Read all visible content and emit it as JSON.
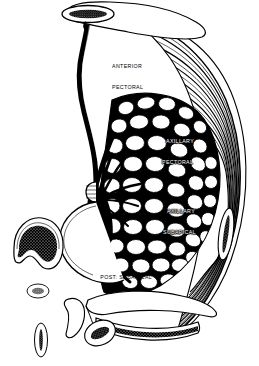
{
  "figure": {
    "type": "anatomical-line-illustration",
    "background_color": "#ffffff",
    "ink_color": "#000000",
    "width": 259,
    "height": 366
  },
  "labels": [
    {
      "id": "anterior-pectoral",
      "line1": "ANTERIOR",
      "line2": "PECTORAL",
      "color": "#000000"
    },
    {
      "id": "axillary-pectoral",
      "line1": "AXILLARY",
      "line2": "PECTORAL",
      "color": "#ffffff"
    },
    {
      "id": "axillary-subapical",
      "line1": "AXILLARY",
      "line2": "SUBAPICAL",
      "color": "#ffffff"
    },
    {
      "id": "post-subapical",
      "line1": "POST: SUBAPICAL",
      "line2": "",
      "color": "#000000"
    }
  ],
  "structures": {
    "apical_node": "apical-lymph-node",
    "clavicular_outline": "infraclavicular-outline",
    "pectoral_fascia": "striated-pectoral-fascia",
    "lymphatic_trunk": "main-lymphatic-trunk",
    "nipple_areola": "nipple-areola-profile",
    "breast_parenchyma": "lobular-breast-parenchyma",
    "isolated_nodes": [
      "large-kidney-node",
      "small-round-node",
      "narrow-oval-node",
      "bottom-oval-node",
      "marginal-elongated-node",
      "inferior-vessel-node"
    ]
  }
}
